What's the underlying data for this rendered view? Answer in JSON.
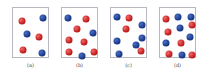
{
  "figure": {
    "panels": [
      {
        "label": "(a)",
        "left": 12,
        "particles": [
          {
            "color": "red",
            "x": 9,
            "y": 13
          },
          {
            "color": "blue",
            "x": 30,
            "y": 10
          },
          {
            "color": "blue",
            "x": 14,
            "y": 26
          },
          {
            "color": "red",
            "x": 26,
            "y": 29
          },
          {
            "color": "red",
            "x": 10,
            "y": 42
          },
          {
            "color": "blue",
            "x": 29,
            "y": 45
          }
        ]
      },
      {
        "label": "(b)",
        "left": 61,
        "particles": [
          {
            "color": "blue",
            "x": 6,
            "y": 10
          },
          {
            "color": "red",
            "x": 24,
            "y": 11
          },
          {
            "color": "red",
            "x": 15,
            "y": 21
          },
          {
            "color": "blue",
            "x": 31,
            "y": 25
          },
          {
            "color": "red",
            "x": 7,
            "y": 32
          },
          {
            "color": "red",
            "x": 22,
            "y": 34
          },
          {
            "color": "red",
            "x": 7,
            "y": 44
          },
          {
            "color": "blue",
            "x": 20,
            "y": 48
          },
          {
            "color": "red",
            "x": 32,
            "y": 44
          }
        ]
      },
      {
        "label": "(c)",
        "left": 110,
        "particles": [
          {
            "color": "blue",
            "x": 6,
            "y": 9
          },
          {
            "color": "red",
            "x": 18,
            "y": 10
          },
          {
            "color": "red",
            "x": 15,
            "y": 21
          },
          {
            "color": "blue",
            "x": 31,
            "y": 17
          },
          {
            "color": "blue",
            "x": 6,
            "y": 33
          },
          {
            "color": "blue",
            "x": 31,
            "y": 30
          },
          {
            "color": "blue",
            "x": 25,
            "y": 37
          },
          {
            "color": "red",
            "x": 30,
            "y": 43
          },
          {
            "color": "blue",
            "x": 8,
            "y": 46
          }
        ]
      },
      {
        "label": "(d)",
        "left": 159,
        "particles": [
          {
            "color": "red",
            "x": 6,
            "y": 11
          },
          {
            "color": "blue",
            "x": 18,
            "y": 9
          },
          {
            "color": "blue",
            "x": 31,
            "y": 9
          },
          {
            "color": "red",
            "x": 32,
            "y": 17
          },
          {
            "color": "red",
            "x": 8,
            "y": 24
          },
          {
            "color": "blue",
            "x": 20,
            "y": 20
          },
          {
            "color": "blue",
            "x": 30,
            "y": 29
          },
          {
            "color": "blue",
            "x": 6,
            "y": 35
          },
          {
            "color": "red",
            "x": 21,
            "y": 35
          },
          {
            "color": "red",
            "x": 9,
            "y": 46
          },
          {
            "color": "blue",
            "x": 22,
            "y": 47
          },
          {
            "color": "red",
            "x": 32,
            "y": 47
          }
        ]
      }
    ],
    "colors": {
      "red": "#c41e1e",
      "blue": "#1a3a8c",
      "frame": "#b8b8c0"
    }
  }
}
